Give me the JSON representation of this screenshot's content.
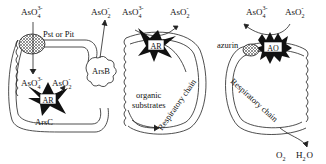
{
  "panels": [
    {
      "id": "panel-1",
      "labels": {
        "arsenate_top": "AsO",
        "arsenate_top_sub": "4",
        "arsenate_top_sup": "3-",
        "transporter": "Pst or Pit",
        "arsenite_out": "AsO",
        "arsenite_out_sub": "2",
        "arsenite_out_sup": "-",
        "arsenate_in": "AsO",
        "arsenate_in_sub": "4",
        "arsenate_in_sup": "3-",
        "arsenite_in": "AsO",
        "arsenite_in_sub": "2",
        "arsenite_in_sup": "-",
        "enzyme": "AR",
        "enzyme_gene": "ArsC",
        "pump": "ArsB"
      }
    },
    {
      "id": "panel-2",
      "labels": {
        "arsenate": "AsO",
        "arsenate_sub": "4",
        "arsenate_sup": "3-",
        "arsenite": "AsO",
        "arsenite_sub": "2",
        "arsenite_sup": "-",
        "enzyme": "AR",
        "substrates_line1": "organic",
        "substrates_line2": "substrates",
        "chain": "Respiratory chain"
      }
    },
    {
      "id": "panel-3",
      "labels": {
        "arsenate": "AsO",
        "arsenate_sub": "4",
        "arsenate_sup": "3-",
        "arsenite": "AsO",
        "arsenite_sub": "2",
        "arsenite_sup": "-",
        "enzyme": "AO",
        "carrier": "azurin",
        "chain": "Respiratory chain",
        "oxygen": "O",
        "oxygen_sub": "2",
        "water_h": "H",
        "water_sub": "2",
        "water_o": "O"
      }
    }
  ],
  "colors": {
    "line": "#222222",
    "fill_dark": "#111111",
    "hatch": "#777777",
    "background": "#ffffff"
  }
}
